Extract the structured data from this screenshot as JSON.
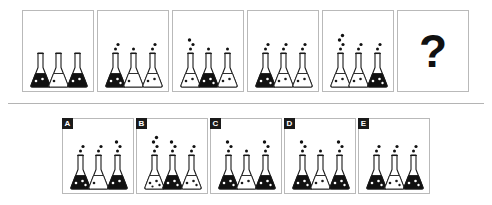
{
  "puzzle": {
    "type": "visual-analogy-matrix",
    "question_mark": "?",
    "colors": {
      "fill_dark": "#111111",
      "fill_light": "#ffffff",
      "outline": "#1a1a1a",
      "panel_border": "#b9b9b9",
      "divider": "#b4b4b4",
      "label_bg": "#1a1a1a",
      "label_text": "#ffffff"
    },
    "sequence": [
      {
        "index": 1,
        "flasks": [
          {
            "fill": "dark",
            "bubbles": 0,
            "specks": 2
          },
          {
            "fill": "light",
            "bubbles": 0,
            "specks": 1
          },
          {
            "fill": "dark",
            "bubbles": 0,
            "specks": 2
          }
        ]
      },
      {
        "index": 2,
        "flasks": [
          {
            "fill": "dark",
            "bubbles": 2,
            "specks": 3
          },
          {
            "fill": "light",
            "bubbles": 1,
            "specks": 1
          },
          {
            "fill": "light",
            "bubbles": 2,
            "specks": 2
          }
        ]
      },
      {
        "index": 3,
        "flasks": [
          {
            "fill": "light",
            "bubbles": 3,
            "specks": 2
          },
          {
            "fill": "dark",
            "bubbles": 1,
            "specks": 3
          },
          {
            "fill": "light",
            "bubbles": 1,
            "specks": 2
          }
        ]
      },
      {
        "index": 4,
        "flasks": [
          {
            "fill": "dark",
            "bubbles": 2,
            "specks": 3
          },
          {
            "fill": "light",
            "bubbles": 2,
            "specks": 2
          },
          {
            "fill": "light",
            "bubbles": 2,
            "specks": 2
          }
        ]
      },
      {
        "index": 5,
        "flasks": [
          {
            "fill": "light",
            "bubbles": 4,
            "specks": 2
          },
          {
            "fill": "light",
            "bubbles": 2,
            "specks": 2
          },
          {
            "fill": "dark",
            "bubbles": 2,
            "specks": 3
          }
        ]
      },
      {
        "index": 6,
        "is_question": true,
        "flasks": []
      }
    ],
    "options": [
      {
        "label": "A",
        "flasks": [
          {
            "fill": "dark",
            "bubbles": 2,
            "specks": 3
          },
          {
            "fill": "light",
            "bubbles": 2,
            "specks": 1
          },
          {
            "fill": "dark",
            "bubbles": 3,
            "specks": 2
          }
        ]
      },
      {
        "label": "B",
        "flasks": [
          {
            "fill": "light",
            "bubbles": 4,
            "specks": 4
          },
          {
            "fill": "dark",
            "bubbles": 3,
            "specks": 3
          },
          {
            "fill": "light",
            "bubbles": 2,
            "specks": 3
          }
        ]
      },
      {
        "label": "C",
        "flasks": [
          {
            "fill": "dark",
            "bubbles": 3,
            "specks": 3
          },
          {
            "fill": "light",
            "bubbles": 1,
            "specks": 2
          },
          {
            "fill": "dark",
            "bubbles": 3,
            "specks": 3
          }
        ]
      },
      {
        "label": "D",
        "flasks": [
          {
            "fill": "dark",
            "bubbles": 3,
            "specks": 3
          },
          {
            "fill": "light",
            "bubbles": 1,
            "specks": 2
          },
          {
            "fill": "dark",
            "bubbles": 3,
            "specks": 3
          }
        ]
      },
      {
        "label": "E",
        "flasks": [
          {
            "fill": "dark",
            "bubbles": 2,
            "specks": 3
          },
          {
            "fill": "light",
            "bubbles": 2,
            "specks": 3
          },
          {
            "fill": "dark",
            "bubbles": 2,
            "specks": 3
          }
        ]
      }
    ],
    "layout": {
      "sequence_panels": [
        {
          "x": 22,
          "y": 10,
          "w": 72,
          "h": 82
        },
        {
          "x": 97,
          "y": 10,
          "w": 72,
          "h": 82
        },
        {
          "x": 172,
          "y": 10,
          "w": 72,
          "h": 82
        },
        {
          "x": 247,
          "y": 10,
          "w": 72,
          "h": 82
        },
        {
          "x": 322,
          "y": 10,
          "w": 72,
          "h": 82
        },
        {
          "x": 397,
          "y": 10,
          "w": 72,
          "h": 82
        }
      ],
      "option_panels": [
        {
          "x": 62,
          "y": 118,
          "w": 72,
          "h": 76
        },
        {
          "x": 136,
          "y": 118,
          "w": 72,
          "h": 76
        },
        {
          "x": 210,
          "y": 118,
          "w": 72,
          "h": 76
        },
        {
          "x": 284,
          "y": 118,
          "w": 72,
          "h": 76
        },
        {
          "x": 358,
          "y": 118,
          "w": 72,
          "h": 76
        }
      ],
      "flask_x_offsets": [
        7,
        25,
        44
      ],
      "flask_width": 21,
      "flask_height": 34
    }
  }
}
